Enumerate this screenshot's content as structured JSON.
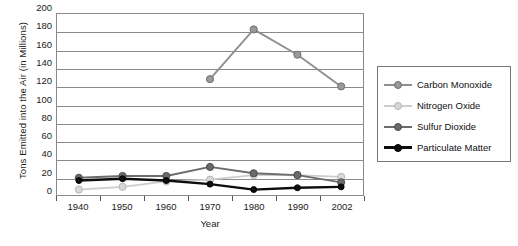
{
  "chart_data": {
    "type": "line",
    "title": "",
    "xlabel": "Year",
    "ylabel": "Tons Emitted into the Air (in Millions)",
    "categories": [
      "1940",
      "1950",
      "1960",
      "1970",
      "1980",
      "1990",
      "2002"
    ],
    "ylim": [
      0,
      200
    ],
    "yticks": [
      0,
      20,
      40,
      60,
      80,
      100,
      120,
      140,
      160,
      180,
      200
    ],
    "ytick_labels": [
      "0",
      "20",
      "40",
      "60",
      "80",
      "100",
      "120",
      "140",
      "160",
      "180",
      "200"
    ],
    "grid": true,
    "legend_position": "right",
    "series": [
      {
        "name": "Carbon Monoxide",
        "color": "#8f8f8f",
        "marker_fill": "#9a9a9a",
        "marker_stroke": "#6e6e6e",
        "values": [
          null,
          null,
          null,
          128,
          183,
          155,
          120
        ]
      },
      {
        "name": "Nitrogen Oxide",
        "color": "#cdcdcd",
        "marker_fill": "#d8d8d8",
        "marker_stroke": "#b4b4b4",
        "values": [
          6,
          9,
          15,
          17,
          22,
          22,
          20
        ]
      },
      {
        "name": "Sulfur Dioxide",
        "color": "#6b6b6b",
        "marker_fill": "#6b6b6b",
        "marker_stroke": "#4a4a4a",
        "values": [
          19,
          21,
          21,
          31,
          24,
          22,
          14
        ]
      },
      {
        "name": "Particulate Matter",
        "color": "#0d0d0d",
        "marker_fill": "#0d0d0d",
        "marker_stroke": "#000000",
        "values": [
          16,
          18,
          16,
          12,
          6,
          8,
          9
        ]
      }
    ]
  },
  "axes": {
    "y_title": "Tons Emitted into the Air (in Millions)",
    "x_title": "Year"
  },
  "legend": {
    "items": [
      {
        "label": "Carbon Monoxide"
      },
      {
        "label": "Nitrogen Oxide"
      },
      {
        "label": "Sulfur Dioxide"
      },
      {
        "label": "Particulate Matter"
      }
    ]
  }
}
